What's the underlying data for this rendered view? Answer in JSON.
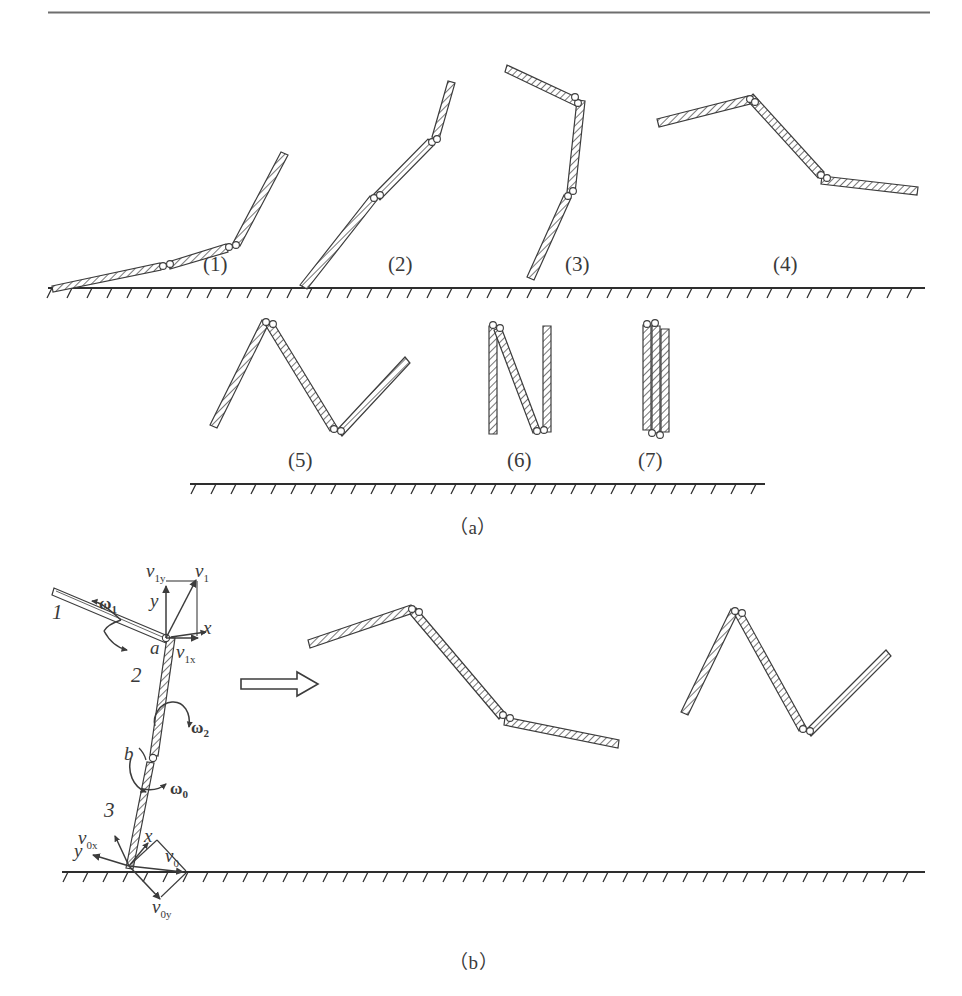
{
  "figure": {
    "stroke_color": "#3c3c3c",
    "hatch_color": "#4a4a4a",
    "ground_color": "#2e2e2e",
    "rule_color": "#6e6e6e"
  },
  "panel_a": {
    "caption": "（a）",
    "steps": [
      {
        "id": "1",
        "label": "(1)"
      },
      {
        "id": "2",
        "label": "(2)"
      },
      {
        "id": "3",
        "label": "(3)"
      },
      {
        "id": "4",
        "label": "(4)"
      },
      {
        "id": "5",
        "label": "(5)"
      },
      {
        "id": "6",
        "label": "(6)"
      },
      {
        "id": "7",
        "label": "(7)"
      }
    ]
  },
  "panel_b": {
    "caption": "（b）",
    "link_labels": [
      {
        "name": "link-1",
        "label": "1"
      },
      {
        "name": "link-2",
        "label": "2"
      },
      {
        "name": "link-3",
        "label": "3"
      }
    ],
    "joint_labels": [
      {
        "name": "joint-a",
        "label": "a"
      },
      {
        "name": "joint-b",
        "label": "b"
      }
    ],
    "angular_velocities": [
      {
        "name": "omega-1",
        "symbol": "ω",
        "subscript": "1"
      },
      {
        "name": "omega-2",
        "symbol": "ω",
        "subscript": "2"
      },
      {
        "name": "omega-0",
        "symbol": "ω",
        "subscript": "0"
      }
    ],
    "velocities": [
      {
        "name": "v-1",
        "symbol": "v",
        "subscript": "1"
      },
      {
        "name": "v-1x",
        "symbol": "v",
        "subscript": "1x"
      },
      {
        "name": "v-1y",
        "symbol": "v",
        "subscript": "1y"
      },
      {
        "name": "v-0",
        "symbol": "v",
        "subscript": "0"
      },
      {
        "name": "v-0x",
        "symbol": "v",
        "subscript": "0x"
      },
      {
        "name": "v-0y",
        "symbol": "v",
        "subscript": "0y"
      }
    ],
    "axis_labels_top": [
      {
        "name": "axis-x-top",
        "label": "x"
      },
      {
        "name": "axis-y-top",
        "label": "y"
      }
    ],
    "axis_labels_bottom": [
      {
        "name": "axis-x-bottom",
        "label": "x"
      },
      {
        "name": "axis-y-bottom",
        "label": "y"
      }
    ],
    "transition_arrow": "⇒"
  },
  "bottom_caption": "　"
}
